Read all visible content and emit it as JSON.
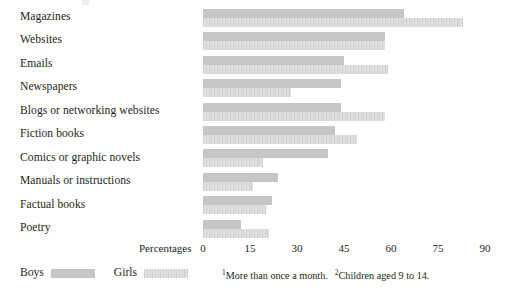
{
  "chart_data": {
    "type": "bar",
    "orientation": "horizontal",
    "title": "",
    "xlabel": "Percentages",
    "ylabel": "",
    "xlim": [
      0,
      90
    ],
    "xticks": [
      0,
      15,
      30,
      45,
      60,
      75,
      90
    ],
    "grid": false,
    "legend_position": "bottom-left",
    "categories": [
      "Magazines",
      "Websites",
      "Emails",
      "Newspapers",
      "Blogs or networking websites",
      "Fiction books",
      "Comics or graphic novels",
      "Manuals or instructions",
      "Factual books",
      "Poetry"
    ],
    "series": [
      {
        "name": "Boys",
        "color": "#c6c6c6",
        "values": [
          64,
          58,
          45,
          44,
          44,
          42,
          40,
          24,
          22,
          12
        ]
      },
      {
        "name": "Girls",
        "color": "#d8d8d8",
        "values": [
          83,
          58,
          59,
          28,
          58,
          49,
          19,
          16,
          20,
          21
        ]
      }
    ],
    "footnotes": [
      {
        "marker": "1",
        "text": "More than once a month."
      },
      {
        "marker": "2",
        "text": "Children aged 9 to 14."
      }
    ]
  },
  "axis": {
    "title": "Percentages",
    "ticks": [
      "0",
      "15",
      "30",
      "45",
      "60",
      "75",
      "90"
    ]
  },
  "legend": {
    "items": [
      {
        "label": "Boys",
        "swatch": "boys-swatch"
      },
      {
        "label": "Girls",
        "swatch": "girls-swatch"
      }
    ]
  }
}
